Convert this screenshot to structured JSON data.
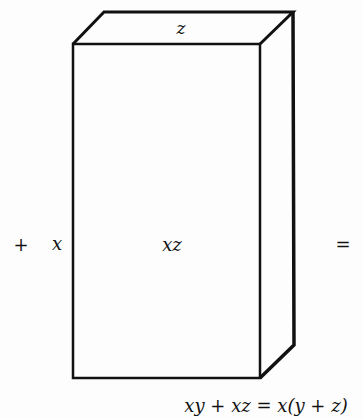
{
  "figure": {
    "box": {
      "top_label": "z",
      "side_label": "x",
      "front_label": "xz"
    },
    "leading_operator": "+",
    "trailing_operator": "=",
    "equation": "xy + xz = x(y + z)",
    "colors": {
      "stroke": "#111111",
      "background": "#fdfdfd"
    }
  }
}
